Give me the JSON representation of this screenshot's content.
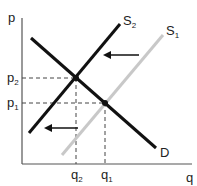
{
  "diagram": {
    "title": "",
    "axes": {
      "y_label": "p",
      "x_label": "q"
    },
    "curves": [
      {
        "id": "S2",
        "label": "S",
        "sub": "2",
        "color": "#111111"
      },
      {
        "id": "S1",
        "label": "S",
        "sub": "1",
        "color": "#c8c8c8"
      },
      {
        "id": "D",
        "label": "D",
        "color": "#111111"
      }
    ],
    "price_levels": [
      {
        "label": "p",
        "sub": "2"
      },
      {
        "label": "p",
        "sub": "1"
      }
    ],
    "quantity_levels": [
      {
        "label": "q",
        "sub": "2"
      },
      {
        "label": "q",
        "sub": "1"
      }
    ],
    "arrows": [
      {
        "direction": "left",
        "meaning": "supply shift"
      },
      {
        "direction": "left",
        "meaning": "supply shift"
      }
    ]
  }
}
